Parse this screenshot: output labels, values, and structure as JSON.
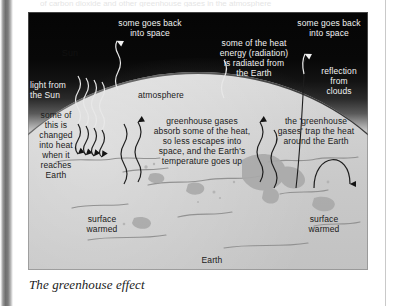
{
  "page": {
    "ghost_text": "of carbon dioxide and other greenhouse gases in the atmosphere",
    "caption": "The greenhouse effect"
  },
  "diagram": {
    "title": "The greenhouse effect",
    "sun_label": "Sun",
    "atmosphere_label": "atmosphere",
    "earth_label": "Earth",
    "labels": {
      "light_from_sun": "light from\nthe Sun",
      "some_goes_back_left": "some goes back\ninto space",
      "heat_radiated": "some of the heat\nenergy (radiation)\nis radiated from\nthe Earth",
      "some_goes_back_right": "some goes back\ninto space",
      "reflection_clouds": "reflection\nfrom\nclouds",
      "changed_into_heat": "some of\nthis is\nchanged\ninto heat\nwhen it\nreaches\nEarth",
      "greenhouse_gases_absorb": "greenhouse gases\nabsorb some of the heat,\nso less escapes into\nspace, and the Earth's\ntemperature goes up",
      "gases_trap_heat": "the 'greenhouse\ngases' trap the heat\naround the Earth",
      "surface_warmed_left": "surface\nwarmed",
      "surface_warmed_right": "surface\nwarmed"
    },
    "colors": {
      "space": "#050505",
      "atmosphere": "#dcdcdc",
      "earth_surface": "#c6c6c6",
      "label_light": "#f2f2f2",
      "label_dark": "#1a1a1a",
      "spine": "#6f6f6f"
    }
  }
}
